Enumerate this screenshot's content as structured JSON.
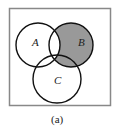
{
  "diagram": {
    "type": "venn",
    "caption": "(a)",
    "sets": [
      {
        "name": "A",
        "label": "A"
      },
      {
        "name": "B",
        "label": "B"
      },
      {
        "name": "C",
        "label": "C"
      }
    ],
    "shaded_region": "B - A",
    "colors": {
      "frame": "#888888",
      "outline": "#111111",
      "shade": "#999999",
      "background": "#ffffff"
    }
  }
}
